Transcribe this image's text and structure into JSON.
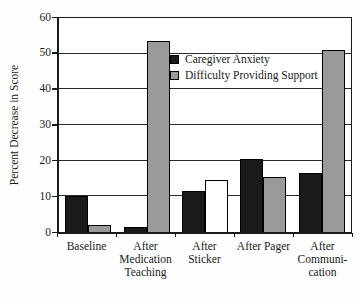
{
  "chart_data": {
    "type": "bar",
    "title": "",
    "xlabel": "",
    "ylabel": "Percent Decrease in Score",
    "ylim": [
      0,
      60
    ],
    "yticks": [
      0,
      10,
      20,
      30,
      40,
      50,
      60
    ],
    "grid": "horizontal",
    "grid_color": "#2b2b2b",
    "legend_position": "inside-upper-middle",
    "categories": [
      "Baseline",
      "After Medication Teaching",
      "After Sticker",
      "After Pager",
      "After Communication"
    ],
    "categories_display": [
      [
        "Baseline"
      ],
      [
        "After",
        "Medication",
        "Teaching"
      ],
      [
        "After Sticker"
      ],
      [
        "After Pager"
      ],
      [
        "After",
        "Communi-",
        "cation"
      ]
    ],
    "series": [
      {
        "name": "Caregiver Anxiety",
        "color": "#1a1a1a",
        "values": [
          10,
          1.5,
          11.5,
          20.5,
          16.5
        ],
        "bar_colors": [
          "#1a1a1a",
          "#1a1a1a",
          "#1a1a1a",
          "#1a1a1a",
          "#1a1a1a"
        ]
      },
      {
        "name": "Difficulty Providing Support",
        "color": "#9a9a9a",
        "values": [
          2,
          53.5,
          14.5,
          15.5,
          51
        ],
        "bar_colors": [
          "#9a9a9a",
          "#9a9a9a",
          "#ffffff",
          "#9a9a9a",
          "#9a9a9a"
        ]
      }
    ],
    "bar_border_color": "#000000"
  }
}
